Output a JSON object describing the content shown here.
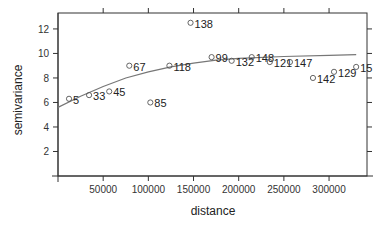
{
  "chart_data": {
    "type": "scatter",
    "title": "",
    "xlabel": "distance",
    "ylabel": "semivariance",
    "xlim": [
      0,
      342000
    ],
    "ylim": [
      0,
      13.3
    ],
    "x_ticks": [
      50000,
      100000,
      150000,
      200000,
      250000,
      300000
    ],
    "x_tick_labels": [
      "50000",
      "100000",
      "150000",
      "200000",
      "250000",
      "300000"
    ],
    "y_ticks": [
      2,
      4,
      6,
      8,
      10,
      12
    ],
    "y_tick_labels": [
      "2",
      "4",
      "6",
      "8",
      "10",
      "12"
    ],
    "grid": false,
    "legend": null,
    "series": [
      {
        "name": "empirical semivariogram",
        "marker": "open-circle",
        "points": [
          {
            "x": 12200,
            "y": 6.3,
            "label": "5"
          },
          {
            "x": 34400,
            "y": 6.6,
            "label": "33"
          },
          {
            "x": 56700,
            "y": 6.9,
            "label": "45"
          },
          {
            "x": 78900,
            "y": 9.0,
            "label": "67"
          },
          {
            "x": 102200,
            "y": 6.0,
            "label": "85"
          },
          {
            "x": 123300,
            "y": 9.0,
            "label": "118"
          },
          {
            "x": 146700,
            "y": 12.5,
            "label": "138"
          },
          {
            "x": 170000,
            "y": 9.7,
            "label": "99"
          },
          {
            "x": 192200,
            "y": 9.4,
            "label": "132"
          },
          {
            "x": 214400,
            "y": 9.7,
            "label": "148"
          },
          {
            "x": 234400,
            "y": 9.3,
            "label": "121"
          },
          {
            "x": 256700,
            "y": 9.3,
            "label": "147"
          },
          {
            "x": 282200,
            "y": 8.0,
            "label": "142"
          },
          {
            "x": 305500,
            "y": 8.5,
            "label": "129"
          },
          {
            "x": 330000,
            "y": 8.9,
            "label": "15"
          }
        ]
      },
      {
        "name": "fitted variogram model",
        "type": "line",
        "x": [
          0,
          25000,
          50000,
          75000,
          100000,
          125000,
          150000,
          175000,
          200000,
          250000,
          300000,
          330000
        ],
        "y": [
          5.6,
          6.5,
          7.3,
          8.0,
          8.5,
          8.9,
          9.2,
          9.45,
          9.6,
          9.75,
          9.85,
          9.9
        ]
      }
    ]
  },
  "colors": {
    "axis": "#333333",
    "marker": "#555555",
    "curve": "#777777"
  }
}
